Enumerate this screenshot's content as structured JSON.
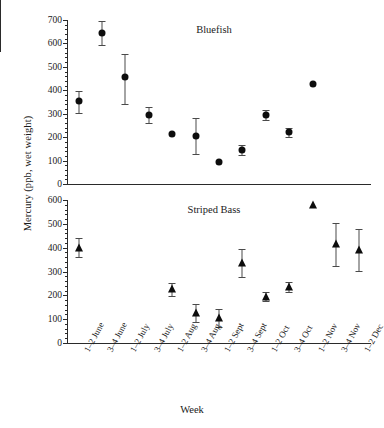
{
  "chart_data": {
    "type": "scatter",
    "title": "",
    "xlabel": "Week",
    "ylabel": "Mercury (ppb, wet weight)",
    "grid": false,
    "legend_position": "none",
    "categories": [
      "1–2 June",
      "3–4 June",
      "1–2 July",
      "3–4 July",
      "1–2 Aug",
      "3–4 Aug",
      "1–2 Sept",
      "3–4 Sept",
      "1–2 Oct",
      "3–4 Oct",
      "1–2 Nov",
      "3–4 Nov",
      "1–2 Dec"
    ],
    "panels": [
      {
        "name": "Bluefish",
        "marker": "filled-circle",
        "ylim": [
          0,
          700
        ],
        "yticks": [
          0,
          100,
          200,
          300,
          400,
          500,
          600,
          700
        ],
        "ytick_labels": [
          "0",
          "100",
          "200",
          "300",
          "400",
          "500",
          "600",
          "700"
        ],
        "points": [
          {
            "x": "1–2 June",
            "xi": 1,
            "y": 355,
            "err_low": 50,
            "err_high": 40
          },
          {
            "x": "3–4 June",
            "xi": 2,
            "y": 645,
            "err_low": 50,
            "err_high": 50
          },
          {
            "x": "1–2 July",
            "xi": 3,
            "y": 455,
            "err_low": 115,
            "err_high": 100
          },
          {
            "x": "3–4 July",
            "xi": 4,
            "y": 295,
            "err_low": 35,
            "err_high": 35
          },
          {
            "x": "1–2 Aug",
            "xi": 5,
            "y": 215,
            "err_low": 0,
            "err_high": 0
          },
          {
            "x": "3–4 Aug",
            "xi": 6,
            "y": 205,
            "err_low": 75,
            "err_high": 75
          },
          {
            "x": "1–2 Sept",
            "xi": 7,
            "y": 95,
            "err_low": 0,
            "err_high": 0
          },
          {
            "x": "3–4 Sept",
            "xi": 8,
            "y": 145,
            "err_low": 22,
            "err_high": 22
          },
          {
            "x": "1–2 Oct",
            "xi": 9,
            "y": 295,
            "err_low": 22,
            "err_high": 22
          },
          {
            "x": "3–4 Oct",
            "xi": 10,
            "y": 220,
            "err_low": 18,
            "err_high": 18
          },
          {
            "x": "1–2 Nov",
            "xi": 11,
            "y": 425,
            "err_low": 0,
            "err_high": 0
          }
        ]
      },
      {
        "name": "Striped Bass",
        "marker": "filled-triangle",
        "ylim": [
          0,
          600
        ],
        "yticks": [
          0,
          100,
          200,
          300,
          400,
          500,
          600
        ],
        "ytick_labels": [
          "0",
          "100",
          "200",
          "300",
          "400",
          "500",
          "600"
        ],
        "points": [
          {
            "x": "1–2 June",
            "xi": 1,
            "y": 400,
            "err_low": 40,
            "err_high": 40
          },
          {
            "x": "1–2 Aug",
            "xi": 5,
            "y": 225,
            "err_low": 28,
            "err_high": 28
          },
          {
            "x": "3–4 Aug",
            "xi": 6,
            "y": 125,
            "err_low": 38,
            "err_high": 38
          },
          {
            "x": "1–2 Sept",
            "xi": 7,
            "y": 105,
            "err_low": 38,
            "err_high": 38
          },
          {
            "x": "3–4 Sept",
            "xi": 8,
            "y": 335,
            "err_low": 58,
            "err_high": 58
          },
          {
            "x": "1–2 Oct",
            "xi": 9,
            "y": 195,
            "err_low": 18,
            "err_high": 18
          },
          {
            "x": "3–4 Oct",
            "xi": 10,
            "y": 235,
            "err_low": 22,
            "err_high": 22
          },
          {
            "x": "1–2 Nov",
            "xi": 11,
            "y": 580,
            "err_low": 0,
            "err_high": 0
          },
          {
            "x": "3–4 Nov",
            "xi": 12,
            "y": 415,
            "err_low": 90,
            "err_high": 90
          },
          {
            "x": "1–2 Dec",
            "xi": 13,
            "y": 390,
            "err_low": 88,
            "err_high": 88
          }
        ]
      }
    ]
  }
}
